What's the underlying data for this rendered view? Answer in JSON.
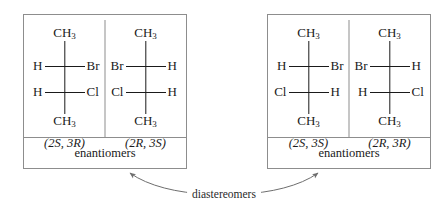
{
  "figure": {
    "type": "stereochemistry-fischer-projection-comparison",
    "relationship_label": "diastereomers",
    "boxes": [
      {
        "id": "box-left",
        "caption": "enantiomers",
        "structures": [
          {
            "descriptor": "(2S, 3R)",
            "top_group": "CH",
            "top_sub": "3",
            "bottom_group": "CH",
            "bottom_sub": "3",
            "c2_left": "H",
            "c2_right": "Br",
            "c3_left": "H",
            "c3_right": "Cl"
          },
          {
            "descriptor": "(2R, 3S)",
            "top_group": "CH",
            "top_sub": "3",
            "bottom_group": "CH",
            "bottom_sub": "3",
            "c2_left": "Br",
            "c2_right": "H",
            "c3_left": "Cl",
            "c3_right": "H"
          }
        ]
      },
      {
        "id": "box-right",
        "caption": "enantiomers",
        "structures": [
          {
            "descriptor": "(2S, 3S)",
            "top_group": "CH",
            "top_sub": "3",
            "bottom_group": "CH",
            "bottom_sub": "3",
            "c2_left": "H",
            "c2_right": "Br",
            "c3_left": "Cl",
            "c3_right": "H"
          },
          {
            "descriptor": "(2R, 3R)",
            "top_group": "CH",
            "top_sub": "3",
            "bottom_group": "CH",
            "bottom_sub": "3",
            "c2_left": "Br",
            "c2_right": "H",
            "c3_left": "H",
            "c3_right": "Cl"
          }
        ]
      }
    ],
    "colors": {
      "bond": "#1a1a1a",
      "box_border": "#8d8d8d",
      "connector": "#6e6e6e",
      "background": "#ffffff"
    }
  }
}
